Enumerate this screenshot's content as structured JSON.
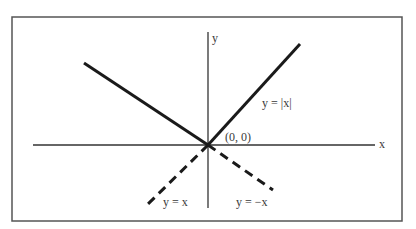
{
  "diagram": {
    "frame": {
      "x": 12,
      "y": 17,
      "width": 390,
      "height": 204,
      "stroke": "#555555"
    },
    "origin": {
      "x": 208,
      "y": 145
    },
    "axes": {
      "x_axis": {
        "x1": 33,
        "y1": 145,
        "x2": 375,
        "y2": 145,
        "label": "x",
        "label_x": 379,
        "label_y": 148
      },
      "y_axis": {
        "x1": 208,
        "y1": 32,
        "x2": 208,
        "y2": 208,
        "label": "y",
        "label_x": 212,
        "label_y": 42
      }
    },
    "lines": {
      "abs_left": {
        "x1": 84,
        "y1": 63,
        "x2": 208,
        "y2": 145,
        "style": "solid"
      },
      "abs_right": {
        "x1": 208,
        "y1": 145,
        "x2": 300,
        "y2": 44,
        "style": "solid"
      },
      "y_eq_x_dashed": {
        "x1": 208,
        "y1": 145,
        "x2": 148,
        "y2": 204,
        "style": "dashed"
      },
      "y_eq_neg_x_dashed": {
        "x1": 208,
        "y1": 145,
        "x2": 273,
        "y2": 190,
        "style": "dashed"
      }
    },
    "labels": {
      "abs": {
        "text": "y = |x|",
        "x": 262,
        "y": 107
      },
      "origin": {
        "text": "(0, 0)",
        "x": 225,
        "y": 141
      },
      "y_eq_x": {
        "text": "y = x",
        "x": 163,
        "y": 206
      },
      "y_eq_neg_x": {
        "text": "y = −x",
        "x": 236,
        "y": 206
      }
    },
    "colors": {
      "line": "#1a1a1a",
      "axis": "#333333",
      "text": "#3a3a3a"
    }
  }
}
